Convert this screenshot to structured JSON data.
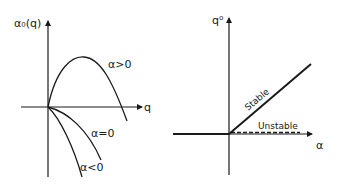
{
  "left_panel": {
    "y_axis_label": "α₀(q)",
    "x_axis_label": "q",
    "curves": [
      {
        "label": "α>0",
        "shape": "parabola rising from origin, peaking, then crossing q-axis"
      },
      {
        "label": "α=0",
        "shape": "decreasing from origin, concave down"
      },
      {
        "label": "α<0",
        "shape": "decreasing more steeply from origin"
      }
    ]
  },
  "right_panel": {
    "y_axis_label": "q⁰",
    "x_axis_label": "α",
    "branches": [
      {
        "label": "Stable",
        "style": "solid",
        "shape": "linear rising for α>0"
      },
      {
        "label": "Unstable",
        "style": "dashed",
        "shape": "along α-axis for α>0"
      }
    ],
    "baseline_note": "solid thick line along α-axis for α<0"
  },
  "colors": {
    "ink": "#1a1a1a",
    "background": "#ffffff"
  }
}
